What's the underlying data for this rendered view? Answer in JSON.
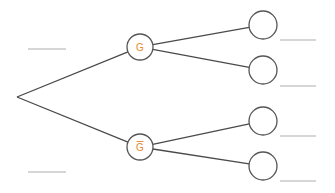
{
  "diagram": {
    "type": "probability-tree",
    "root": {
      "x": 17,
      "y": 97
    },
    "first_level": [
      {
        "label": "G",
        "negated": false,
        "cx": 140,
        "cy": 47,
        "r": 13
      },
      {
        "label": "G",
        "negated": true,
        "cx": 140,
        "cy": 147,
        "r": 13
      }
    ],
    "leaves": [
      {
        "cx": 263,
        "cy": 25,
        "r": 14,
        "parent": 0
      },
      {
        "cx": 263,
        "cy": 70,
        "r": 14,
        "parent": 0
      },
      {
        "cx": 263,
        "cy": 121,
        "r": 14,
        "parent": 1
      },
      {
        "cx": 263,
        "cy": 166,
        "r": 14,
        "parent": 1
      }
    ],
    "blanks_left": [
      {
        "x1": 28,
        "x2": 66,
        "y": 49
      },
      {
        "x1": 28,
        "x2": 66,
        "y": 172
      }
    ],
    "blanks_right": [
      {
        "x1": 280,
        "x2": 316,
        "y": 40
      },
      {
        "x1": 280,
        "x2": 316,
        "y": 86
      },
      {
        "x1": 280,
        "x2": 316,
        "y": 136
      },
      {
        "x1": 280,
        "x2": 316,
        "y": 181
      }
    ],
    "colors": {
      "branch": "#4a4a4a",
      "node_stroke": "#555555",
      "label": "#e8892b",
      "blank": "#c8c8c8"
    }
  }
}
